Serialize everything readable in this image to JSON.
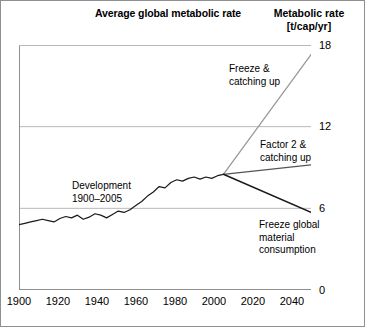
{
  "figure": {
    "title": "Average global metabolic rate",
    "axis_title": "Metabolic rate",
    "axis_unit": "[t/cap/yr]"
  },
  "annotations": {
    "freeze_catching_up": "Freeze &\ncatching up",
    "factor2_catching_up": "Factor 2 &\ncatching up",
    "development": "Development\n1900–2005",
    "freeze_material": "Freeze global\nmaterial\nconsumption"
  },
  "ticks": {
    "y": [
      "0",
      "6",
      "12",
      "18"
    ],
    "x": [
      "1900",
      "1920",
      "1940",
      "1960",
      "1980",
      "2000",
      "2020",
      "2040"
    ]
  },
  "colors": {
    "historical_line": "#1a1a1a",
    "scenario_up": "#9a9a9a",
    "scenario_flat": "#555555",
    "scenario_down": "#1a1a1a",
    "gridline": "#b8b8b8",
    "axis": "#8f8f8f",
    "background": "#ffffff"
  },
  "chart_data": {
    "type": "line",
    "title": "Average global metabolic rate",
    "xlabel": "",
    "ylabel": "Metabolic rate [t/cap/yr]",
    "xlim": [
      1900,
      2050
    ],
    "ylim": [
      0,
      18
    ],
    "yticks": [
      0,
      6,
      12,
      18
    ],
    "xticks": [
      1900,
      1920,
      1940,
      1960,
      1980,
      2000,
      2020,
      2040
    ],
    "grid": "horizontal",
    "legend": "none (inline annotations)",
    "branch_point": {
      "x": 2005,
      "y": 8.5
    },
    "series": [
      {
        "name": "Development 1900–2005",
        "style": "solid",
        "color": "#1a1a1a",
        "x": [
          1900,
          1903,
          1906,
          1909,
          1912,
          1915,
          1918,
          1921,
          1924,
          1927,
          1930,
          1933,
          1936,
          1939,
          1942,
          1945,
          1948,
          1951,
          1954,
          1957,
          1960,
          1963,
          1966,
          1969,
          1972,
          1975,
          1978,
          1981,
          1984,
          1987,
          1990,
          1993,
          1996,
          1999,
          2002,
          2005
        ],
        "y": [
          4.8,
          4.9,
          5.0,
          5.1,
          5.2,
          5.1,
          5.0,
          5.25,
          5.4,
          5.3,
          5.5,
          5.2,
          5.35,
          5.6,
          5.5,
          5.3,
          5.55,
          5.8,
          5.7,
          5.9,
          6.2,
          6.5,
          6.9,
          7.2,
          7.6,
          7.5,
          7.9,
          8.1,
          8.0,
          8.2,
          8.3,
          8.15,
          8.3,
          8.2,
          8.4,
          8.5
        ]
      },
      {
        "name": "Freeze & catching up",
        "style": "solid",
        "color": "#9a9a9a",
        "x": [
          2005,
          2050
        ],
        "y": [
          8.5,
          17.3
        ]
      },
      {
        "name": "Factor 2 & catching up",
        "style": "solid",
        "color": "#555555",
        "x": [
          2005,
          2050
        ],
        "y": [
          8.5,
          9.2
        ]
      },
      {
        "name": "Freeze global material consumption",
        "style": "solid",
        "color": "#1a1a1a",
        "x": [
          2005,
          2050
        ],
        "y": [
          8.5,
          5.7
        ]
      }
    ]
  }
}
